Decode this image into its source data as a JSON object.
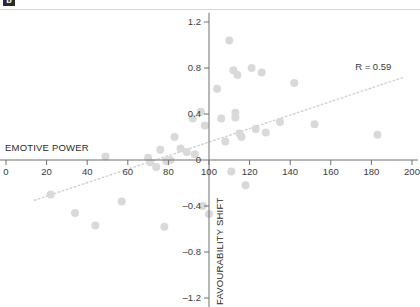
{
  "figure": {
    "panel_tag": "b",
    "annotation": "R = 0.59",
    "x_axis_title": "EMOTIVE POWER",
    "y_axis_title": "FAVOURABILITY SHIFT"
  },
  "chart_data": {
    "type": "scatter",
    "title": "",
    "xlabel": "EMOTIVE POWER",
    "ylabel": "FAVOURABILITY SHIFT",
    "xlim": [
      0,
      200
    ],
    "ylim": [
      -1.2,
      1.2
    ],
    "xticks": [
      0,
      20,
      40,
      60,
      80,
      100,
      120,
      140,
      160,
      180,
      200
    ],
    "yticks": [
      1.2,
      0.8,
      0.4,
      0,
      -0.4,
      -0.8,
      -1.2
    ],
    "xtick_labels": [
      "0",
      "20",
      "40",
      "60",
      "80",
      "100",
      "120",
      "140",
      "160",
      "180",
      "200"
    ],
    "ytick_labels": [
      "1.2",
      "0.8",
      "0.4",
      "0",
      "–0.4",
      "–0.8",
      "–1.2"
    ],
    "grid": false,
    "legend": null,
    "annotations": [
      {
        "text": "R = 0.59",
        "x": 172,
        "y": 0.78
      }
    ],
    "series": [
      {
        "name": "studies",
        "marker": "circle",
        "color": "#d9d9d9",
        "points": [
          {
            "x": 22,
            "y": -0.3
          },
          {
            "x": 34,
            "y": -0.46
          },
          {
            "x": 44,
            "y": -0.57
          },
          {
            "x": 49,
            "y": 0.03
          },
          {
            "x": 57,
            "y": -0.36
          },
          {
            "x": 70,
            "y": 0.02
          },
          {
            "x": 71,
            "y": -0.02
          },
          {
            "x": 74,
            "y": -0.06
          },
          {
            "x": 76,
            "y": 0.09
          },
          {
            "x": 78,
            "y": -0.58
          },
          {
            "x": 79,
            "y": -0.01
          },
          {
            "x": 81,
            "y": 0.0
          },
          {
            "x": 83,
            "y": 0.2
          },
          {
            "x": 86,
            "y": 0.1
          },
          {
            "x": 89,
            "y": 0.07
          },
          {
            "x": 92,
            "y": 0.36
          },
          {
            "x": 93,
            "y": 0.05
          },
          {
            "x": 96,
            "y": 0.42
          },
          {
            "x": 97,
            "y": -0.4
          },
          {
            "x": 98,
            "y": 0.3
          },
          {
            "x": 100,
            "y": -0.47
          },
          {
            "x": 104,
            "y": 0.62
          },
          {
            "x": 106,
            "y": 0.36
          },
          {
            "x": 108,
            "y": 0.16
          },
          {
            "x": 110,
            "y": 1.04
          },
          {
            "x": 111,
            "y": -0.1
          },
          {
            "x": 112,
            "y": 0.78
          },
          {
            "x": 113,
            "y": 0.41
          },
          {
            "x": 113,
            "y": 0.37
          },
          {
            "x": 114,
            "y": 0.74
          },
          {
            "x": 115,
            "y": 0.23
          },
          {
            "x": 116,
            "y": 0.2
          },
          {
            "x": 118,
            "y": -0.22
          },
          {
            "x": 121,
            "y": 0.8
          },
          {
            "x": 123,
            "y": 0.27
          },
          {
            "x": 126,
            "y": 0.76
          },
          {
            "x": 128,
            "y": 0.24
          },
          {
            "x": 135,
            "y": 0.33
          },
          {
            "x": 142,
            "y": 0.67
          },
          {
            "x": 152,
            "y": 0.31
          },
          {
            "x": 183,
            "y": 0.22
          }
        ]
      }
    ],
    "trendline": {
      "style": "dotted",
      "color": "#d0d0d0",
      "x_start": 14,
      "y_start": -0.35,
      "x_end": 196,
      "y_end": 0.72
    }
  }
}
